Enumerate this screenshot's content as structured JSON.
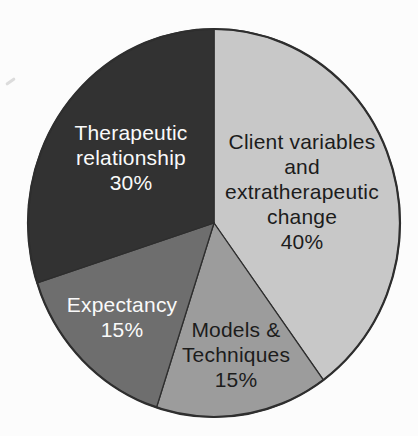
{
  "figure": {
    "background": "#fcfcfc",
    "outline_color": "#2e2e2e"
  },
  "chart_data": {
    "type": "pie",
    "title": "",
    "direction": "clockwise",
    "start_angle_deg": 0,
    "legend": "none",
    "slices": [
      {
        "id": "client-variables",
        "label": "Client variables and extratherapeutic change",
        "label_lines": [
          "Client variables",
          "and",
          "extratherapeutic",
          "change"
        ],
        "pct_label": "40%",
        "value": 40,
        "color": "#c8c8c8",
        "text_color": "#1c1c1c"
      },
      {
        "id": "models-techniques",
        "label": "Models & Techniques",
        "label_lines": [
          "Models &",
          "Techniques"
        ],
        "pct_label": "15%",
        "value": 15,
        "color": "#9c9c9c",
        "text_color": "#1c1c1c"
      },
      {
        "id": "expectancy",
        "label": "Expectancy",
        "label_lines": [
          "Expectancy"
        ],
        "pct_label": "15%",
        "value": 15,
        "color": "#6e6e6e",
        "text_color": "#fafafa"
      },
      {
        "id": "therapeutic-relationship",
        "label": "Therapeutic relationship",
        "label_lines": [
          "Therapeutic",
          "relationship"
        ],
        "pct_label": "30%",
        "value": 30,
        "color": "#323232",
        "text_color": "#fafafa"
      }
    ]
  }
}
